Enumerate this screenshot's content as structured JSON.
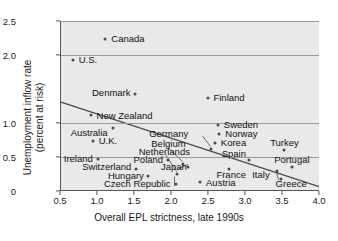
{
  "chart_data": {
    "type": "scatter",
    "title": "",
    "xlabel": "Overall EPL strictness, late 1990s",
    "ylabel": "Unemployment inflow rate\n(percent at risk)",
    "ylabel_line1": "Unemployment inflow rate",
    "ylabel_line2": "(percent at risk)",
    "xlim": [
      0.5,
      4.0
    ],
    "ylim": [
      0.0,
      2.5
    ],
    "xticks": [
      "0.5",
      "1.0",
      "1.5",
      "2.0",
      "2.5",
      "3.0",
      "3.5",
      "4.0"
    ],
    "xtick_values": [
      0.5,
      1.0,
      1.5,
      2.0,
      2.5,
      3.0,
      3.5,
      4.0
    ],
    "yticks": [
      "0",
      "0.5",
      "1.0",
      "2.0",
      "2.5"
    ],
    "ytick_values": [
      0,
      0.5,
      1.0,
      2.0,
      2.5
    ],
    "gridlines": [
      0.5,
      1.0,
      2.0,
      2.5
    ],
    "grid": true,
    "legend": "none",
    "marker_color": "#4a4a4a",
    "plot_bg": "#e9e9e9",
    "trendline": {
      "label": "fitted regression line",
      "x0": 0.5,
      "y0": 1.3,
      "x1": 4.0,
      "y1": 0.05
    },
    "points": [
      {
        "name": "Canada",
        "x": 1.1,
        "y": 2.23,
        "lx": 1.18,
        "ly": 2.23,
        "align": "left"
      },
      {
        "name": "U.S.",
        "x": 0.66,
        "y": 1.93,
        "lx": 0.74,
        "ly": 1.93,
        "align": "left"
      },
      {
        "name": "Denmark",
        "x": 1.5,
        "y": 1.42,
        "lx": 1.44,
        "ly": 1.44,
        "align": "right"
      },
      {
        "name": "Finland",
        "x": 2.48,
        "y": 1.37,
        "lx": 2.56,
        "ly": 1.37,
        "align": "left"
      },
      {
        "name": "New Zealand",
        "x": 0.9,
        "y": 1.12,
        "lx": 0.98,
        "ly": 1.11,
        "align": "left"
      },
      {
        "name": "Sweden",
        "x": 2.62,
        "y": 0.97,
        "lx": 2.7,
        "ly": 0.97,
        "align": "left"
      },
      {
        "name": "Australia",
        "x": 1.2,
        "y": 0.93,
        "lx": 1.13,
        "ly": 0.86,
        "align": "right"
      },
      {
        "name": "Norway",
        "x": 2.64,
        "y": 0.84,
        "lx": 2.72,
        "ly": 0.84,
        "align": "left"
      },
      {
        "name": "Germany",
        "x": 2.53,
        "y": 0.62,
        "lx": 2.22,
        "ly": 0.84,
        "align": "right"
      },
      {
        "name": "U.K.",
        "x": 0.93,
        "y": 0.74,
        "lx": 1.01,
        "ly": 0.74,
        "align": "left"
      },
      {
        "name": "Korea",
        "x": 2.58,
        "y": 0.7,
        "lx": 2.66,
        "ly": 0.7,
        "align": "left"
      },
      {
        "name": "Turkey",
        "x": 3.52,
        "y": 0.6,
        "lx": 3.52,
        "ly": 0.7,
        "align": "center"
      },
      {
        "name": "Belgium",
        "x": 2.15,
        "y": 0.4,
        "lx": 1.72,
        "ly": 0.69,
        "align": "left"
      },
      {
        "name": "Netherlands",
        "x": 2.07,
        "y": 0.25,
        "lx": 1.55,
        "ly": 0.58,
        "align": "left"
      },
      {
        "name": "Spain",
        "x": 3.04,
        "y": 0.45,
        "lx": 3.0,
        "ly": 0.55,
        "align": "right"
      },
      {
        "name": "Ireland",
        "x": 1.0,
        "y": 0.47,
        "lx": 0.93,
        "ly": 0.47,
        "align": "right"
      },
      {
        "name": "Poland",
        "x": 1.95,
        "y": 0.46,
        "lx": 1.88,
        "ly": 0.46,
        "align": "right"
      },
      {
        "name": "Portugal",
        "x": 3.62,
        "y": 0.36,
        "lx": 3.62,
        "ly": 0.45,
        "align": "center"
      },
      {
        "name": "Switzerland",
        "x": 1.52,
        "y": 0.33,
        "lx": 1.45,
        "ly": 0.35,
        "align": "right"
      },
      {
        "name": "Japan",
        "x": 2.22,
        "y": 0.36,
        "lx": 1.85,
        "ly": 0.35,
        "align": "left"
      },
      {
        "name": "Italy",
        "x": 3.42,
        "y": 0.3,
        "lx": 3.32,
        "ly": 0.24,
        "align": "right"
      },
      {
        "name": "Hungary",
        "x": 1.68,
        "y": 0.22,
        "lx": 1.62,
        "ly": 0.22,
        "align": "right"
      },
      {
        "name": "France",
        "x": 2.77,
        "y": 0.33,
        "lx": 2.6,
        "ly": 0.23,
        "align": "left"
      },
      {
        "name": "Czech Republic",
        "x": 2.05,
        "y": 0.11,
        "lx": 1.98,
        "ly": 0.1,
        "align": "right"
      },
      {
        "name": "Greece",
        "x": 3.47,
        "y": 0.17,
        "lx": 3.4,
        "ly": 0.11,
        "align": "left"
      },
      {
        "name": "Austria",
        "x": 2.38,
        "y": 0.13,
        "lx": 2.46,
        "ly": 0.12,
        "align": "left"
      }
    ],
    "leader_lines": [
      {
        "from_label": "Germany",
        "x0": 2.42,
        "y0": 0.8,
        "x1": 2.53,
        "y1": 0.64
      },
      {
        "from_label": "Belgium",
        "x0": 1.95,
        "y0": 0.63,
        "x1": 2.15,
        "y1": 0.42
      },
      {
        "from_label": "Netherlands",
        "x0": 1.92,
        "y0": 0.52,
        "x1": 2.07,
        "y1": 0.27
      },
      {
        "from_label": "Japan",
        "x0": 2.08,
        "y0": 0.3,
        "x1": 2.22,
        "y1": 0.38
      },
      {
        "from_label": "Czech Republic",
        "x0": 2.04,
        "y0": 0.06,
        "x1": 2.04,
        "y1": 0.2
      },
      {
        "from_label": "Greece",
        "x0": 3.45,
        "y0": 0.15,
        "x1": 3.42,
        "y1": 0.28
      }
    ]
  }
}
